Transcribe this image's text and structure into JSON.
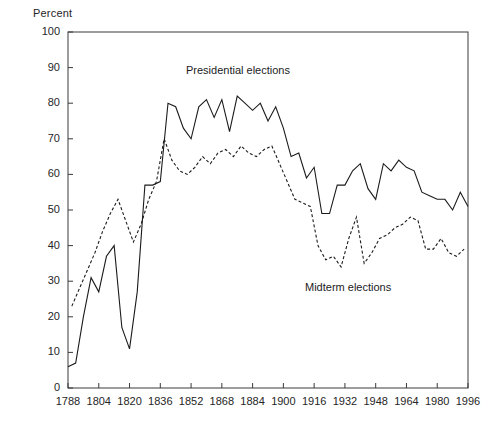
{
  "axis": {
    "y_title": "Percent",
    "y_ticks": [
      0,
      10,
      20,
      30,
      40,
      50,
      60,
      70,
      80,
      90,
      100
    ],
    "x_ticks": [
      1788,
      1804,
      1820,
      1836,
      1852,
      1868,
      1884,
      1900,
      1916,
      1932,
      1948,
      1964,
      1980,
      1996
    ]
  },
  "annotations": {
    "presidential": "Presidential elections",
    "midterm": "Midterm elections"
  },
  "colors": {
    "line": "#1b1b1b",
    "axis": "#3a3a3a",
    "text": "#262626",
    "background": "#ffffff"
  },
  "chart_data": {
    "type": "line",
    "title": "",
    "xlabel": "",
    "ylabel": "Percent",
    "xlim": [
      1788,
      1996
    ],
    "ylim": [
      0,
      100
    ],
    "grid": false,
    "legend": "inline-annotations",
    "series": [
      {
        "name": "Presidential elections",
        "style": "solid",
        "x": [
          1788,
          1792,
          1796,
          1800,
          1804,
          1808,
          1812,
          1816,
          1820,
          1824,
          1828,
          1832,
          1836,
          1840,
          1844,
          1848,
          1852,
          1856,
          1860,
          1864,
          1868,
          1872,
          1876,
          1880,
          1884,
          1888,
          1892,
          1896,
          1900,
          1904,
          1908,
          1912,
          1916,
          1920,
          1924,
          1928,
          1932,
          1936,
          1940,
          1944,
          1948,
          1952,
          1956,
          1960,
          1964,
          1968,
          1972,
          1976,
          1980,
          1984,
          1988,
          1992,
          1996
        ],
        "values": [
          6,
          7,
          20,
          31,
          27,
          37,
          40,
          17,
          11,
          27,
          57,
          57,
          58,
          80,
          79,
          73,
          70,
          79,
          81,
          76,
          81,
          72,
          82,
          80,
          78,
          80,
          75,
          79,
          73,
          65,
          66,
          59,
          62,
          49,
          49,
          57,
          57,
          61,
          63,
          56,
          53,
          63,
          61,
          64,
          62,
          61,
          55,
          54,
          53,
          53,
          50,
          55,
          51
        ],
        "color": "#1b1b1b"
      },
      {
        "name": "Midterm elections",
        "style": "dashed",
        "x": [
          1790,
          1794,
          1798,
          1802,
          1806,
          1810,
          1814,
          1818,
          1822,
          1826,
          1830,
          1834,
          1838,
          1842,
          1846,
          1850,
          1854,
          1858,
          1862,
          1866,
          1870,
          1874,
          1878,
          1882,
          1886,
          1890,
          1894,
          1898,
          1902,
          1906,
          1910,
          1914,
          1918,
          1922,
          1926,
          1930,
          1934,
          1938,
          1942,
          1946,
          1950,
          1954,
          1958,
          1962,
          1966,
          1970,
          1974,
          1978,
          1982,
          1986,
          1990,
          1994
        ],
        "values": [
          23,
          28,
          33,
          38,
          44,
          49,
          53,
          47,
          41,
          46,
          53,
          58,
          70,
          64,
          61,
          60,
          62,
          65,
          63,
          66,
          67,
          65,
          68,
          66,
          65,
          67,
          68,
          63,
          58,
          53,
          52,
          51,
          40,
          36,
          37,
          34,
          42,
          48,
          35,
          38,
          42,
          43,
          45,
          46,
          48,
          47,
          39,
          39,
          42,
          38,
          37,
          39
        ],
        "color": "#1b1b1b"
      }
    ]
  }
}
